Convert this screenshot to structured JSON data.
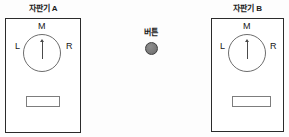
{
  "diagram": {
    "background_color": "#fdfdfd",
    "line_color": "#2b2b2b"
  },
  "machines": [
    {
      "id": "machine-a",
      "title": "자판기 A",
      "dial": {
        "left_label": "L",
        "middle_label": "M",
        "right_label": "R",
        "needle_direction": "up",
        "needle_points_to": "M"
      },
      "slot": {
        "name": "dispense-slot"
      }
    },
    {
      "id": "machine-b",
      "title": "자판기 B",
      "dial": {
        "left_label": "L",
        "middle_label": "M",
        "right_label": "R",
        "needle_direction": "up",
        "needle_points_to": "M"
      },
      "slot": {
        "name": "dispense-slot"
      }
    }
  ],
  "button": {
    "label": "버튼",
    "color": "#7c7c7c",
    "border_color": "#3d3d3d"
  }
}
